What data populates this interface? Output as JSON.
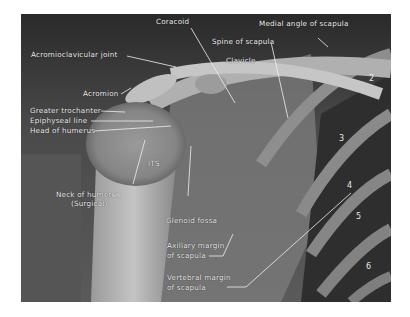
{
  "figure": {
    "labels": {
      "coracoid": "Coracoid",
      "medial_angle": "Medial angle of scapula",
      "acromioclavicular": "Acromioclavicular joint",
      "spine_of_scapula": "Spine of scapula",
      "clavicle": "Clavicle",
      "acromion": "Acromion",
      "greater_trochanter": "Greater trochanter",
      "epiphyseal_line": "Epiphyseal line",
      "head_of_humerus": "Head of humerus",
      "its": "ITS",
      "neck_line1": "Neck of humerus",
      "neck_line2": "(Surgical)",
      "glenoid_fossa": "Glenoid fossa",
      "axillary_line1": "Axillary margin",
      "axillary_line2": "of scapula",
      "vertebral_line1": "Vertebral margin",
      "vertebral_line2": "of scapula"
    },
    "rib_numbers": [
      "2",
      "3",
      "4",
      "5",
      "6"
    ]
  }
}
